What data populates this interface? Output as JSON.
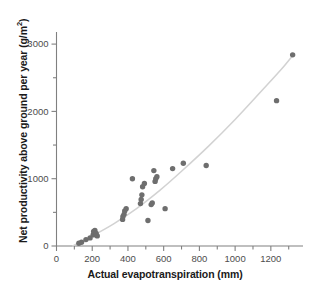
{
  "chart_data": {
    "type": "scatter",
    "title": "",
    "xlabel": "Actual evapotranspiration (mm)",
    "ylabel": "Net productivity above ground per year (g/m²)",
    "ylabel_main": "Net productivity above ground per year (g/m",
    "ylabel_sup": "2",
    "ylabel_tail": ")",
    "xlim": [
      0,
      1380
    ],
    "ylim": [
      0,
      3150
    ],
    "grid": false,
    "legend": null,
    "xticks": [
      0,
      200,
      400,
      600,
      800,
      1000,
      1200
    ],
    "xtick_labels": [
      "0",
      "200",
      "400",
      "600",
      "800",
      "1000",
      "1200"
    ],
    "xminor_ticks": [
      100,
      300,
      500,
      700,
      900,
      1100,
      1300
    ],
    "yticks": [
      0,
      1000,
      2000,
      3000
    ],
    "ytick_labels": [
      "0",
      "1000",
      "2000",
      "3000"
    ],
    "yminor_ticks": [
      500,
      1500,
      2500
    ],
    "point_color": "#6e6e6e",
    "curve_color": "#d2d2d2",
    "axis_color": "#808080",
    "points": [
      {
        "x": 125,
        "y": 40
      },
      {
        "x": 140,
        "y": 55
      },
      {
        "x": 165,
        "y": 95
      },
      {
        "x": 188,
        "y": 120
      },
      {
        "x": 205,
        "y": 165
      },
      {
        "x": 208,
        "y": 215
      },
      {
        "x": 215,
        "y": 230
      },
      {
        "x": 222,
        "y": 185
      },
      {
        "x": 228,
        "y": 150
      },
      {
        "x": 370,
        "y": 395
      },
      {
        "x": 372,
        "y": 440
      },
      {
        "x": 378,
        "y": 470
      },
      {
        "x": 382,
        "y": 520
      },
      {
        "x": 390,
        "y": 555
      },
      {
        "x": 425,
        "y": 1000
      },
      {
        "x": 470,
        "y": 630
      },
      {
        "x": 474,
        "y": 690
      },
      {
        "x": 478,
        "y": 760
      },
      {
        "x": 482,
        "y": 880
      },
      {
        "x": 492,
        "y": 930
      },
      {
        "x": 512,
        "y": 380
      },
      {
        "x": 530,
        "y": 615
      },
      {
        "x": 536,
        "y": 640
      },
      {
        "x": 545,
        "y": 1120
      },
      {
        "x": 552,
        "y": 960
      },
      {
        "x": 556,
        "y": 1000
      },
      {
        "x": 562,
        "y": 1030
      },
      {
        "x": 608,
        "y": 555
      },
      {
        "x": 650,
        "y": 1150
      },
      {
        "x": 710,
        "y": 1230
      },
      {
        "x": 838,
        "y": 1195
      },
      {
        "x": 1232,
        "y": 2160
      },
      {
        "x": 1322,
        "y": 2840
      }
    ],
    "fit_curve": [
      {
        "x": 90,
        "y": 0
      },
      {
        "x": 200,
        "y": 150
      },
      {
        "x": 320,
        "y": 330
      },
      {
        "x": 450,
        "y": 560
      },
      {
        "x": 580,
        "y": 830
      },
      {
        "x": 700,
        "y": 1110
      },
      {
        "x": 850,
        "y": 1480
      },
      {
        "x": 1000,
        "y": 1880
      },
      {
        "x": 1150,
        "y": 2310
      },
      {
        "x": 1260,
        "y": 2630
      },
      {
        "x": 1325,
        "y": 2840
      }
    ]
  }
}
